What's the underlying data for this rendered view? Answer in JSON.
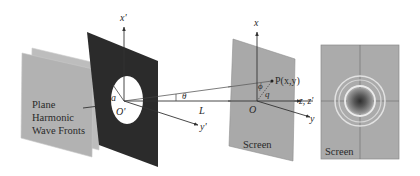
{
  "diagram": {
    "type": "fraunhofer-circular-aperture-diffraction",
    "wave_fronts": {
      "label_lines": [
        "Plane",
        "Harmonic",
        "Wave Fronts"
      ],
      "color": "#b4b4b4"
    },
    "aperture": {
      "plate_color": "#2b2b2b",
      "opening_color": "#ffffff",
      "radius_label": "a",
      "origin_label": "O'",
      "axis_x_label": "x'",
      "axis_y_label": "y'"
    },
    "geometry_labels": {
      "angle": "θ",
      "distance": "L",
      "azimuth": "ϕ",
      "radial": "q",
      "point": "P(x,y)",
      "screen_origin": "O",
      "axis_x": "x",
      "axis_y": "y",
      "axis_z": "z, z'"
    },
    "screen_oblique": {
      "label": "Screen",
      "color": "#a9a9a9"
    },
    "screen_pattern": {
      "label": "Screen",
      "color": "#ababab",
      "center_color": "#3a3a3a",
      "ring_color": "#e6e6e6",
      "ring_count": 3
    }
  }
}
